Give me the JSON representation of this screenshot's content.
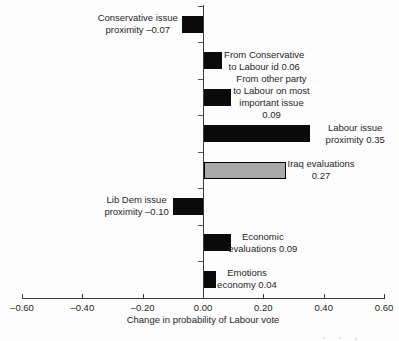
{
  "chart_data": {
    "type": "bar",
    "orientation": "horizontal",
    "title": "",
    "xlabel": "Change in probability of Labour vote",
    "xlim": [
      -0.6,
      0.6
    ],
    "grid": false,
    "legend": false,
    "x_ticks": [
      {
        "value": -0.6,
        "label": "–0.60"
      },
      {
        "value": -0.4,
        "label": "–0.40"
      },
      {
        "value": -0.2,
        "label": "–0.20"
      },
      {
        "value": 0.0,
        "label": "0.00"
      },
      {
        "value": 0.2,
        "label": "0.20"
      },
      {
        "value": 0.4,
        "label": "0.40"
      },
      {
        "value": 0.6,
        "label": "0.60"
      }
    ],
    "bars": [
      {
        "name": "conservative-issue-proximity",
        "value": -0.07,
        "color": "black",
        "label_side": "left",
        "label_gap": 4,
        "label_lines": [
          "Conservative issue",
          "proximity –0.07"
        ]
      },
      {
        "name": "conservative-to-labour-id",
        "value": 0.06,
        "color": "black",
        "label_side": "right",
        "label_gap": 3,
        "label_lines": [
          "From Conservative",
          "to Labour id 0.06"
        ]
      },
      {
        "name": "other-party-to-labour-issue",
        "value": 0.09,
        "color": "black",
        "label_side": "right",
        "label_gap": 3,
        "label_lines": [
          "From other party",
          "to Labour on most",
          "important issue",
          "0.09"
        ]
      },
      {
        "name": "labour-issue-proximity",
        "value": 0.35,
        "color": "black",
        "label_side": "right",
        "label_gap": 17,
        "label_lines": [
          "Labour issue",
          "proximity 0.35"
        ]
      },
      {
        "name": "iraq-evaluations",
        "value": 0.27,
        "color": "gray",
        "label_side": "right",
        "label_gap": 3,
        "label_lines": [
          "Iraq evaluations",
          "0.27"
        ]
      },
      {
        "name": "lib-dem-issue-proximity",
        "value": -0.1,
        "color": "black",
        "label_side": "left",
        "label_gap": 4,
        "label_lines": [
          "Lib Dem issue",
          "proximity –0.10"
        ]
      },
      {
        "name": "economic-evaluations",
        "value": 0.09,
        "color": "black",
        "label_side": "right",
        "label_gap": -2,
        "label_lines": [
          "Economic",
          "evaluations 0.09"
        ]
      },
      {
        "name": "emotions-economy",
        "value": 0.04,
        "color": "black",
        "label_side": "right",
        "label_gap": 2,
        "label_lines": [
          "Emotions",
          "economy 0.04"
        ]
      }
    ],
    "colors": {
      "bar_black": "#0a0a0a",
      "bar_gray": "#a8a8a8",
      "bar_border": "#000000",
      "axis": "#3c3c3c",
      "text": "#262626",
      "background": "#fdfdfd"
    }
  }
}
